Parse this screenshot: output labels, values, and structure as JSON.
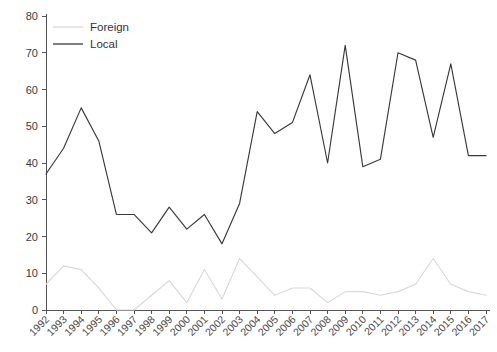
{
  "chart_data": {
    "type": "line",
    "title": "",
    "subtitle": "",
    "xlabel": "",
    "ylabel": "",
    "ylim": [
      0,
      80
    ],
    "yticks": [
      0,
      10,
      20,
      30,
      40,
      50,
      60,
      70,
      80
    ],
    "grid": false,
    "legend_position": "top-left",
    "categories": [
      "1992",
      "1993",
      "1994",
      "1995",
      "1996",
      "1997",
      "1998",
      "1999",
      "2000",
      "2001",
      "2002",
      "2003",
      "2004",
      "2005",
      "2006",
      "2007",
      "2008",
      "2009",
      "2010",
      "2011",
      "2012",
      "2013",
      "2014",
      "2015",
      "2016",
      "2017"
    ],
    "series": [
      {
        "name": "Foreign",
        "color": "#d9d9d9",
        "values": [
          7,
          12,
          11,
          6,
          0,
          0,
          4,
          8,
          2,
          11,
          3,
          14,
          9,
          4,
          6,
          6,
          2,
          5,
          5,
          4,
          5,
          7,
          14,
          7,
          5,
          4
        ]
      },
      {
        "name": "Local",
        "color": "#3a3a3a",
        "values": [
          37,
          44,
          55,
          46,
          26,
          26,
          21,
          28,
          22,
          26,
          18,
          29,
          54,
          48,
          51,
          64,
          40,
          72,
          39,
          41,
          70,
          68,
          47,
          67,
          42,
          42
        ]
      }
    ]
  },
  "legend": {
    "items": [
      {
        "label": "Foreign",
        "color": "#d9d9d9"
      },
      {
        "label": "Local",
        "color": "#3a3a3a"
      }
    ]
  },
  "axes": {
    "y_tick_labels": [
      "0",
      "10",
      "20",
      "30",
      "40",
      "50",
      "60",
      "70",
      "80"
    ],
    "x_tick_labels": [
      "1992",
      "1993",
      "1994",
      "1995",
      "1996",
      "1997",
      "1998",
      "1999",
      "2000",
      "2001",
      "2002",
      "2003",
      "2004",
      "2005",
      "2006",
      "2007",
      "2008",
      "2009",
      "2010",
      "2011",
      "2012",
      "2013",
      "2014",
      "2015",
      "2016",
      "2017"
    ]
  }
}
